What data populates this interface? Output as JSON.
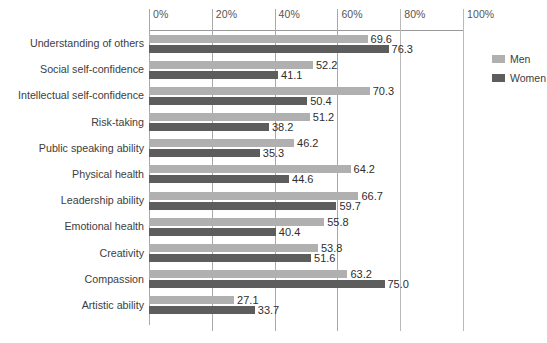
{
  "chart_data": {
    "type": "bar",
    "orientation": "horizontal",
    "title": "",
    "xlabel": "",
    "ylabel": "",
    "xlim": [
      0,
      100
    ],
    "grid": true,
    "legend_position": "right",
    "tick_labels": [
      "0%",
      "20%",
      "40%",
      "60%",
      "80%",
      "100%"
    ],
    "tick_values": [
      0,
      20,
      40,
      60,
      80,
      100
    ],
    "categories": [
      "Understanding of others",
      "Social self-confidence",
      "Intellectual self-confidence",
      "Risk-taking",
      "Public speaking ability",
      "Physical health",
      "Leadership ability",
      "Emotional health",
      "Creativity",
      "Compassion",
      "Artistic ability"
    ],
    "series": [
      {
        "name": "Men",
        "color": "#b0b0b0",
        "values": [
          69.6,
          52.2,
          70.3,
          51.2,
          46.2,
          64.2,
          66.7,
          55.8,
          53.8,
          63.2,
          27.1
        ],
        "labels": [
          "69.6",
          "52.2",
          "70.3",
          "51.2",
          "46.2",
          "64.2",
          "66.7",
          "55.8",
          "53.8",
          "63.2",
          "27.1"
        ]
      },
      {
        "name": "Women",
        "color": "#5d5d5d",
        "values": [
          76.3,
          41.1,
          50.4,
          38.2,
          35.3,
          44.6,
          59.7,
          40.4,
          51.6,
          75.0,
          33.7
        ],
        "labels": [
          "76.3",
          "41.1",
          "50.4",
          "38.2",
          "35.3",
          "44.6",
          "59.7",
          "40.4",
          "51.6",
          "75.0",
          "33.7"
        ]
      }
    ]
  },
  "legend": {
    "items": [
      {
        "label": "Men",
        "color": "#b0b0b0"
      },
      {
        "label": "Women",
        "color": "#5d5d5d"
      }
    ]
  }
}
